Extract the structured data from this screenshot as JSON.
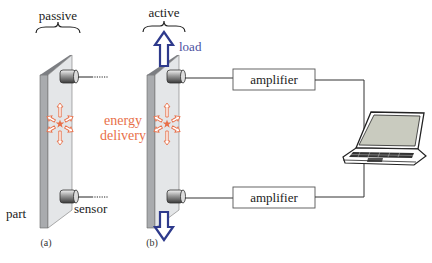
{
  "labels": {
    "passive": "passive",
    "active": "active",
    "load": "load",
    "energy_line1": "energy",
    "energy_line2": "delivery",
    "part": "part",
    "sensor": "sensor",
    "amplifier_top": "amplifier",
    "amplifier_bottom": "amplifier",
    "caption_a": "(a)",
    "caption_b": "(b)"
  },
  "colors": {
    "energy": "#e8704a",
    "load_arrow": "#2e3a8c",
    "load_text": "#4a4fa0",
    "plate_front": "#e4e6e8",
    "plate_side": "#a9abae",
    "line": "#333333",
    "screen": "#c9cbbf"
  },
  "icons": {
    "laptop": "laptop-icon",
    "sensor": "sensor-cylinder-icon",
    "load_arrow": "double-arrow-icon",
    "energy_star": "star-burst-icon"
  }
}
